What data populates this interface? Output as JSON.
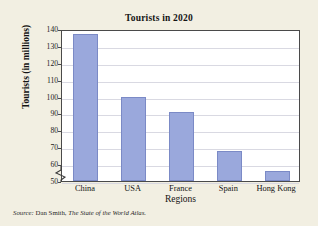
{
  "chart_data": {
    "type": "bar",
    "title": "Tourists in 2020",
    "xlabel": "Regions",
    "ylabel": "Tourists (in millions)",
    "categories": [
      "China",
      "USA",
      "France",
      "Spain",
      "Hong Kong"
    ],
    "values": [
      137,
      100,
      91,
      68,
      56
    ],
    "ylim": [
      50,
      140
    ],
    "ytick_labels": [
      "140",
      "130",
      "120",
      "110",
      "100",
      "90",
      "80",
      "70",
      "60",
      "50"
    ],
    "ytick_values": [
      140,
      130,
      120,
      110,
      100,
      90,
      80,
      70,
      60,
      50
    ],
    "grid": true,
    "legend": "none",
    "axis_break": true,
    "bar_color": "#9aa8dc",
    "bar_border_color": "#7b8ac6",
    "plot_background": "#ffffff",
    "page_background": "#f2efe2",
    "grid_color": "#d9d9e2",
    "frame_color": "#4a4a4a"
  },
  "source": {
    "prefix": "Source:",
    "author": "Dan Smith,",
    "work": "The State of the World Atlas."
  }
}
